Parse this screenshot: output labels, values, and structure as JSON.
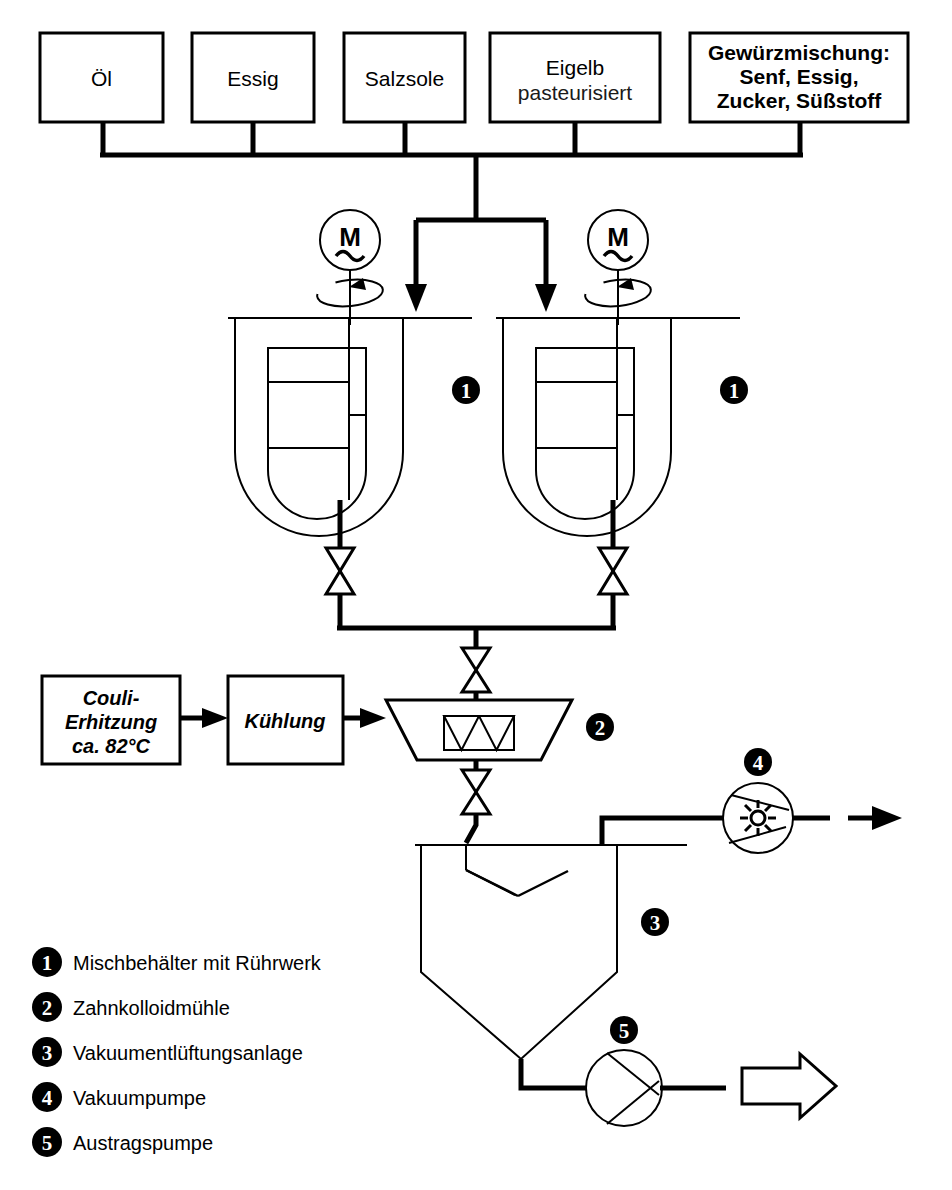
{
  "diagram": {
    "ingredient_boxes": [
      {
        "id": "oel",
        "line1": "Öl",
        "line2": "",
        "line3": ""
      },
      {
        "id": "essig",
        "line1": "Essig",
        "line2": "",
        "line3": ""
      },
      {
        "id": "salzsole",
        "line1": "Salzsole",
        "line2": "",
        "line3": ""
      },
      {
        "id": "eigelb",
        "line1": "Eigelb",
        "line2": "pasteurisiert",
        "line3": ""
      },
      {
        "id": "gewuerzmischung",
        "line1": "Gewürzmischung:",
        "line2": "Senf, Essig,",
        "line3": "Zucker, Süßstoff"
      }
    ],
    "process_boxes": [
      {
        "id": "couli",
        "line1": "Couli-",
        "line2": "Erhitzung",
        "line3": "ca. 82°C"
      },
      {
        "id": "kuehlung",
        "line1": "Kühlung",
        "line2": "",
        "line3": ""
      }
    ],
    "motors": [
      {
        "id": "motor-left",
        "label": "M",
        "phase": "~"
      },
      {
        "id": "motor-right",
        "label": "M",
        "phase": "~"
      }
    ],
    "equipment_badges": [
      {
        "number": "1",
        "equipment": "mixing-vessel-left"
      },
      {
        "number": "1",
        "equipment": "mixing-vessel-right"
      },
      {
        "number": "2",
        "equipment": "colloid-mill"
      },
      {
        "number": "3",
        "equipment": "vacuum-deaeration-tank"
      },
      {
        "number": "4",
        "equipment": "vacuum-pump"
      },
      {
        "number": "5",
        "equipment": "discharge-pump"
      }
    ],
    "legend": [
      {
        "number": "1",
        "label": "Mischbehälter mit Rührwerk"
      },
      {
        "number": "2",
        "label": "Zahnkolloidmühle"
      },
      {
        "number": "3",
        "label": "Vakuumentlüftungsanlage"
      },
      {
        "number": "4",
        "label": "Vakuumpumpe"
      },
      {
        "number": "5",
        "label": "Austragspumpe"
      }
    ],
    "colors": {
      "line": "#000000",
      "background": "#ffffff",
      "badge_fill": "#000000",
      "badge_text": "#ffffff"
    }
  }
}
